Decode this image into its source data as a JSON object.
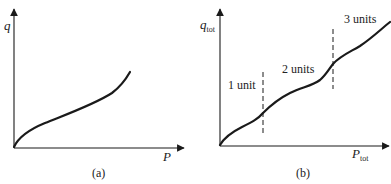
{
  "panels": [
    {
      "id": "a",
      "caption": "(a)",
      "y_label": "q",
      "x_label": "P",
      "y_label_sub": "",
      "x_label_sub": "",
      "curve": "single smooth increasing curve from origin"
    },
    {
      "id": "b",
      "caption": "(b)",
      "y_label": "q",
      "y_label_sub": "tot",
      "x_label": "P",
      "x_label_sub": "tot",
      "regions": [
        {
          "label": "1 unit"
        },
        {
          "label": "2 units"
        },
        {
          "label": "3 units"
        }
      ],
      "dividers": 2
    }
  ],
  "colors": {
    "ink": "#1a1a1a",
    "background": "#ffffff"
  }
}
